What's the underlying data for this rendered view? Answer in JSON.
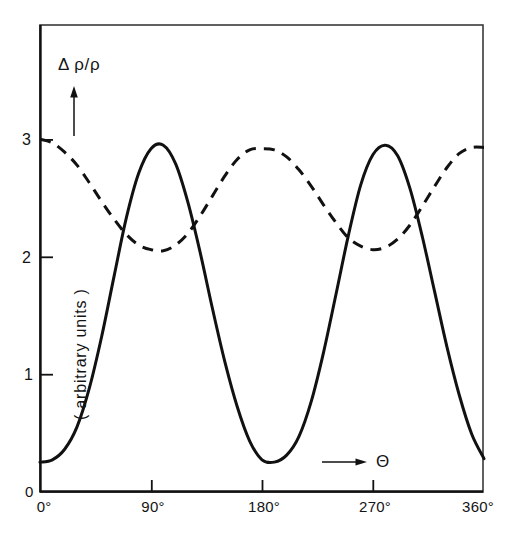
{
  "figure": {
    "background_color": "#ffffff",
    "line_color": "#111111",
    "frame_color": "#333333"
  },
  "axes": {
    "y_axis_title": "Δ ρ/ρ",
    "y_axis_units": "( arbitrary  units )",
    "x_axis_symbol": "Θ",
    "y_arrow_icon": "up-arrow-icon",
    "x_arrow_icon": "right-arrow-icon",
    "origin_label": "0",
    "y_ticks": [
      {
        "value": 1,
        "label": "1"
      },
      {
        "value": 2,
        "label": "2"
      },
      {
        "value": 3,
        "label": "3"
      }
    ],
    "x_ticks": [
      {
        "value": 0,
        "label": "0°"
      },
      {
        "value": 90,
        "label": "90°"
      },
      {
        "value": 180,
        "label": "180°"
      },
      {
        "value": 270,
        "label": "270°"
      },
      {
        "value": 360,
        "label": "360°"
      }
    ]
  },
  "chart_data": {
    "type": "line",
    "title": "",
    "subtitle": "",
    "xlabel": "Θ",
    "ylabel": "Δ ρ/ρ ( arbitrary  units )",
    "xlim": [
      0,
      360
    ],
    "ylim": [
      0,
      3.55
    ],
    "grid": false,
    "legend": "none",
    "x_tick_values": [
      0,
      90,
      180,
      270,
      360
    ],
    "x_tick_labels": [
      "0°",
      "90°",
      "180°",
      "270°",
      "360°"
    ],
    "y_tick_values": [
      0,
      1,
      2,
      3
    ],
    "y_tick_labels": [
      "0",
      "1",
      "2",
      "3"
    ],
    "annotations": [
      {
        "text": "Δ ρ/ρ",
        "x": 30,
        "y": 3.35,
        "note": "y-axis quantity with upward arrow"
      },
      {
        "text": "Θ",
        "x": 295,
        "y": 0.42,
        "note": "x-axis quantity with rightward arrow"
      }
    ],
    "series": [
      {
        "name": "solid-curve",
        "style": "solid",
        "color": "#111111",
        "period_deg": 180,
        "min": 0.25,
        "max": 2.95,
        "x": [
          0,
          10,
          20,
          30,
          40,
          50,
          60,
          70,
          80,
          90,
          100,
          110,
          120,
          130,
          140,
          150,
          160,
          170,
          180,
          190,
          200,
          210,
          220,
          230,
          240,
          250,
          260,
          270,
          280,
          290,
          300,
          310,
          320,
          330,
          340,
          350,
          360
        ],
        "values": [
          0.25,
          0.27,
          0.36,
          0.55,
          0.88,
          1.32,
          1.83,
          2.33,
          2.71,
          2.92,
          2.95,
          2.79,
          2.46,
          2.03,
          1.55,
          1.1,
          0.72,
          0.43,
          0.27,
          0.25,
          0.31,
          0.47,
          0.77,
          1.19,
          1.68,
          2.18,
          2.61,
          2.87,
          2.95,
          2.86,
          2.58,
          2.17,
          1.7,
          1.23,
          0.82,
          0.49,
          0.28
        ]
      },
      {
        "name": "dashed-curve",
        "style": "dashed",
        "color": "#111111",
        "period_deg": 180,
        "min": 2.05,
        "max": 3.0,
        "x": [
          0,
          10,
          20,
          30,
          40,
          50,
          60,
          70,
          80,
          90,
          100,
          110,
          120,
          130,
          140,
          150,
          160,
          170,
          180,
          190,
          200,
          210,
          220,
          230,
          240,
          250,
          260,
          270,
          280,
          290,
          300,
          310,
          320,
          330,
          340,
          350,
          360
        ],
        "values": [
          3.0,
          2.97,
          2.89,
          2.78,
          2.63,
          2.47,
          2.32,
          2.19,
          2.1,
          2.06,
          2.05,
          2.1,
          2.2,
          2.35,
          2.52,
          2.69,
          2.83,
          2.91,
          2.92,
          2.91,
          2.85,
          2.74,
          2.6,
          2.44,
          2.29,
          2.16,
          2.09,
          2.06,
          2.08,
          2.15,
          2.27,
          2.43,
          2.6,
          2.76,
          2.88,
          2.93,
          2.93
        ]
      }
    ]
  }
}
